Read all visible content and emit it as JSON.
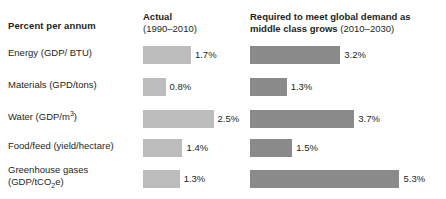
{
  "header": {
    "row_axis_label": "Percent per annum",
    "col1_title": "Actual",
    "col1_subtitle": "(1990–2010)",
    "col2_title": "Required to meet global demand as middle class grows ",
    "col2_title_line1": "Required to meet global demand as",
    "col2_title_line2": "middle class grows ",
    "col2_subtitle": "(2010–2030)"
  },
  "colors": {
    "actual_bar": "#bcbcbc",
    "required_bar": "#8a8a8a",
    "text": "#231f20",
    "background": "#ffffff"
  },
  "rows": [
    {
      "label_html": "Energy (GDP/ BTU)",
      "label_line1": "Energy (GDP/ BTU)",
      "label_line2": "",
      "actual": "1.7%",
      "required": "3.2%"
    },
    {
      "label_html": "Materials (GPD/tons)",
      "label_line1": "Materials (GPD/tons)",
      "label_line2": "",
      "actual": "0.8%",
      "required": "1.3%"
    },
    {
      "label_html": "Water (GDP/m<sup>3</sup>)",
      "label_line1": "Water (GDP/m³)",
      "label_line2": "",
      "actual": "2.5%",
      "required": "3.7%"
    },
    {
      "label_html": "Food/feed (yield/hectare)",
      "label_line1": "Food/feed (yield/hectare)",
      "label_line2": "",
      "actual": "1.4%",
      "required": "1.5%"
    },
    {
      "label_html": "Greenhouse gases<br>(GDP/tCO<sub>2</sub>e)",
      "label_line1": "Greenhouse gases",
      "label_line2": "(GDP/tCO₂e)",
      "actual": "1.3%",
      "required": "5.3%"
    }
  ],
  "chart_data": {
    "type": "bar",
    "title": "Percent per annum",
    "xlabel": "Percent per annum",
    "ylabel": "",
    "grid": false,
    "legend_position": "top",
    "orientation": "horizontal",
    "value_unit": "%",
    "xlim": [
      0,
      5.5
    ],
    "categories": [
      "Energy (GDP/ BTU)",
      "Materials (GPD/tons)",
      "Water (GDP/m3)",
      "Food/feed (yield/hectare)",
      "Greenhouse gases (GDP/tCO2e)"
    ],
    "series": [
      {
        "name": "Actual (1990–2010)",
        "color": "#bcbcbc",
        "values": [
          1.7,
          0.8,
          2.5,
          1.4,
          1.3
        ],
        "labels": [
          "1.7%",
          "0.8%",
          "2.5%",
          "1.4%",
          "1.3%"
        ]
      },
      {
        "name": "Required to meet global demand as middle class grows (2010–2030)",
        "color": "#8a8a8a",
        "values": [
          3.2,
          1.3,
          3.7,
          1.5,
          5.3
        ],
        "labels": [
          "3.2%",
          "1.3%",
          "3.7%",
          "1.5%",
          "5.3%"
        ]
      }
    ]
  }
}
